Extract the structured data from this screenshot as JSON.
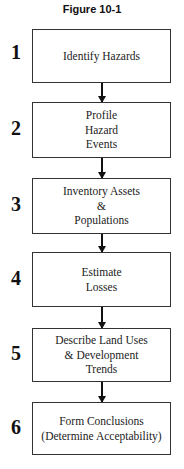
{
  "figure": {
    "title": "Figure 10-1"
  },
  "steps": [
    {
      "number": "1",
      "label": "Identify Hazards"
    },
    {
      "number": "2",
      "label": "Profile\nHazard\nEvents"
    },
    {
      "number": "3",
      "label": "Inventory Assets\n&\nPopulations"
    },
    {
      "number": "4",
      "label": "Estimate\nLosses"
    },
    {
      "number": "5",
      "label": "Describe Land Uses\n& Development\nTrends"
    },
    {
      "number": "6",
      "label": "Form Conclusions\n(Determine Acceptability)"
    }
  ]
}
